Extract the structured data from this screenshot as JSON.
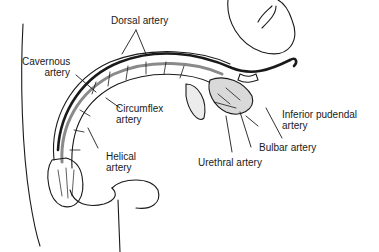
{
  "figure": {
    "colors": {
      "line": "#1a1a1a",
      "shade": "#8a8a8a",
      "fill": "#ffffff"
    },
    "labels": {
      "dorsal_artery": "Dorsal artery",
      "cavernous_artery_1": "Cavernous",
      "cavernous_artery_2": "artery",
      "circumflex_artery_1": "Circumflex",
      "circumflex_artery_2": "artery",
      "helical_artery_1": "Helical",
      "helical_artery_2": "artery",
      "inferior_pudendal_artery_1": "Inferior pudendal",
      "inferior_pudendal_artery_2": "artery",
      "bulbar_artery": "Bulbar artery",
      "urethral_artery": "Urethral artery"
    }
  }
}
